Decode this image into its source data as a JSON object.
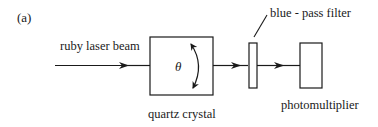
{
  "figure": {
    "panel_label": "(a)",
    "components": {
      "input_beam": {
        "label": "ruby laser beam"
      },
      "crystal": {
        "label": "quartz crystal",
        "angle_symbol": "θ",
        "rotation": "bidirectional-curved-arrow"
      },
      "filter": {
        "label": "blue - pass filter"
      },
      "detector": {
        "label": "photomultiplier"
      }
    },
    "colors": {
      "stroke": "#1a1a1a",
      "background": "#ffffff"
    }
  }
}
